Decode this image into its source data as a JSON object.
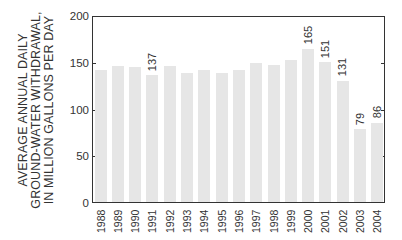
{
  "chart_data": {
    "type": "bar",
    "title": "",
    "xlabel": "",
    "ylabel": "AVERAGE ANNUAL DAILY GROUND-WATER WITHDRAWAL, IN MILLION GALLONS PER DAY",
    "ylabel_lines": [
      "AVERAGE ANNUAL DAILY",
      "GROUND-WATER WITHDRAWAL,",
      "IN MILLION GALLONS PER DAY"
    ],
    "ylim": [
      0,
      200
    ],
    "yticks": [
      0,
      50,
      100,
      150,
      200
    ],
    "grid": false,
    "legend": null,
    "bar_color": "#e6e6e6",
    "categories": [
      "1988",
      "1989",
      "1990",
      "1991",
      "1992",
      "1993",
      "1994",
      "1995",
      "1996",
      "1997",
      "1998",
      "1999",
      "2000",
      "2001",
      "2002",
      "2003",
      "2004"
    ],
    "values": [
      142,
      146,
      145,
      137,
      146,
      139,
      142,
      139,
      142,
      150,
      148,
      153,
      165,
      151,
      131,
      79,
      86
    ],
    "data_labels": {
      "1991": "137",
      "2000": "165",
      "2001": "151",
      "2002": "131",
      "2003": "79",
      "2004": "86"
    }
  }
}
